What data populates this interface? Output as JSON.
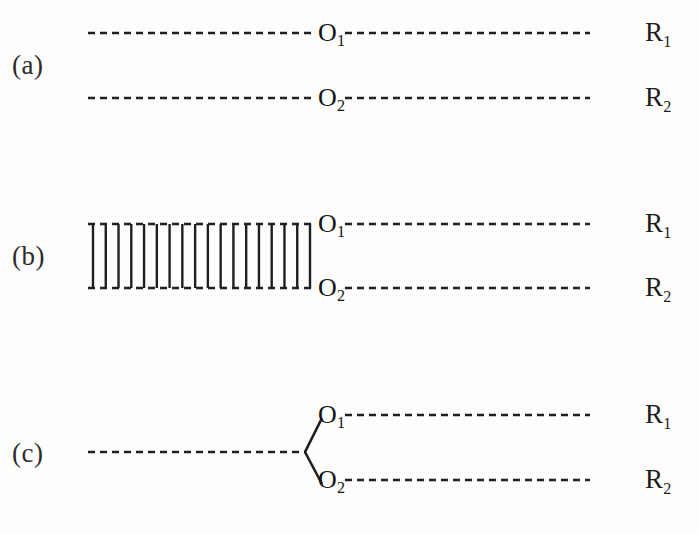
{
  "figure": {
    "width": 699,
    "height": 534,
    "background": "#fdfdfc",
    "ink_color": "#1f1f1f"
  },
  "panels": [
    {
      "id": "a",
      "letter": "(a)",
      "letter_x": 12,
      "letter_y": 50,
      "description": "two independent parallel dashed reference lines",
      "lines": [
        {
          "name": "line-r1",
          "y": 33,
          "x_start": 88,
          "x_end": 590,
          "style": "dashed",
          "node": "O1",
          "node_x": 330,
          "axis": "R1"
        },
        {
          "name": "line-r2",
          "y": 98,
          "x_start": 88,
          "x_end": 590,
          "style": "dashed",
          "node": "O2",
          "node_x": 330,
          "axis": "R2"
        }
      ],
      "rungs": [],
      "branch": null
    },
    {
      "id": "b",
      "letter": "(b)",
      "letter_x": 12,
      "letter_y": 241,
      "description": "two dashed reference lines coupled by a ladder of vertical rungs on the left segment",
      "lines": [
        {
          "name": "line-r1",
          "y": 224,
          "x_start": 88,
          "x_end": 590,
          "style": "dashed",
          "node": "O1",
          "node_x": 330,
          "axis": "R1"
        },
        {
          "name": "line-r2",
          "y": 288,
          "x_start": 88,
          "x_end": 590,
          "style": "dashed",
          "node": "O2",
          "node_x": 330,
          "axis": "R2"
        }
      ],
      "rungs": {
        "count": 18,
        "x_first": 93,
        "x_last": 310,
        "y_top": 224,
        "y_bottom": 288,
        "style": "solid"
      },
      "branch": null
    },
    {
      "id": "c",
      "letter": "(c)",
      "letter_x": 12,
      "letter_y": 438,
      "description": "one dashed trunk line splitting at a vertex into two solid branches that reach O1 and O2",
      "lines": [
        {
          "name": "line-r1",
          "y": 415,
          "x_start": 345,
          "x_end": 590,
          "style": "dashed",
          "node": "O1",
          "node_x": 330,
          "axis": "R1"
        },
        {
          "name": "line-r2",
          "y": 480,
          "x_start": 345,
          "x_end": 590,
          "style": "dashed",
          "node": "O2",
          "node_x": 330,
          "axis": "R2"
        }
      ],
      "rungs": [],
      "branch": {
        "trunk_x_start": 88,
        "trunk_x_end": 305,
        "trunk_y": 452,
        "trunk_style": "dashed",
        "vertex_x": 305,
        "vertex_y": 452,
        "upper_end_x": 322,
        "upper_end_y": 418,
        "lower_end_x": 322,
        "lower_end_y": 484,
        "branch_style": "solid"
      }
    }
  ],
  "labels": {
    "node_o1": "O",
    "node_o1_sub": "1",
    "node_o2": "O",
    "node_o2_sub": "2",
    "axis_r1": "R",
    "axis_r1_sub": "1",
    "axis_r2": "R",
    "axis_r2_sub": "2",
    "axis_x": 645
  }
}
